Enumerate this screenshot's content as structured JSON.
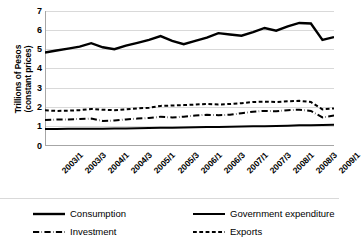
{
  "chart_data": {
    "type": "line",
    "title": "",
    "xlabel": "",
    "ylabel": "Trillions of Pesos (constant prices)",
    "ylabel_line1": "Trillions of Pesos",
    "ylabel_line2": "(constant prices)",
    "ylim": [
      0,
      7
    ],
    "ytick_values": [
      0,
      1,
      2,
      3,
      4,
      5,
      6,
      7
    ],
    "ytick_labels": [
      "0",
      "1",
      "2",
      "3",
      "4",
      "5",
      "6",
      "7"
    ],
    "grid": true,
    "grid_axis": "y",
    "legend_position": "bottom",
    "x": [
      "2003/1",
      "2003/2",
      "2003/3",
      "2003/4",
      "2004/1",
      "2004/2",
      "2004/3",
      "2004/4",
      "2005/1",
      "2005/2",
      "2005/3",
      "2005/4",
      "2006/1",
      "2006/2",
      "2006/3",
      "2006/4",
      "2007/1",
      "2007/2",
      "2007/3",
      "2007/4",
      "2008/1",
      "2008/2",
      "2008/3",
      "2008/4",
      "2009/1",
      "2009/2"
    ],
    "xtick_labels": [
      "2003/1",
      "2003/3",
      "2004/1",
      "2004/3",
      "2005/1",
      "2005/3",
      "2006/1",
      "2006/3",
      "2007/1",
      "2007/3",
      "2008/1",
      "2008/3",
      "2009/1"
    ],
    "series": [
      {
        "name": "Consumption",
        "style": "solid",
        "width": 2.4,
        "color": "#000000",
        "values": [
          4.85,
          4.95,
          5.05,
          5.15,
          5.33,
          5.12,
          5.02,
          5.2,
          5.35,
          5.5,
          5.7,
          5.45,
          5.28,
          5.45,
          5.62,
          5.85,
          5.78,
          5.72,
          5.9,
          6.12,
          5.98,
          6.2,
          6.38,
          6.35,
          5.5,
          5.65
        ]
      },
      {
        "name": "Government expenditure",
        "style": "solid",
        "width": 2.0,
        "color": "#000000",
        "values": [
          0.88,
          0.88,
          0.89,
          0.9,
          0.9,
          0.9,
          0.91,
          0.91,
          0.92,
          0.93,
          0.94,
          0.95,
          0.96,
          0.97,
          0.98,
          0.99,
          1.0,
          1.01,
          1.02,
          1.03,
          1.04,
          1.05,
          1.07,
          1.08,
          1.09,
          1.1
        ]
      },
      {
        "name": "Investment",
        "style": "dashdot",
        "width": 2.0,
        "color": "#000000",
        "values": [
          1.35,
          1.37,
          1.38,
          1.4,
          1.42,
          1.3,
          1.32,
          1.38,
          1.42,
          1.45,
          1.52,
          1.48,
          1.52,
          1.58,
          1.62,
          1.6,
          1.62,
          1.7,
          1.78,
          1.82,
          1.8,
          1.86,
          1.88,
          1.82,
          1.48,
          1.58
        ]
      },
      {
        "name": "Exports",
        "style": "dashed",
        "width": 2.0,
        "color": "#000000",
        "values": [
          1.85,
          1.82,
          1.83,
          1.86,
          1.92,
          1.88,
          1.86,
          1.9,
          1.95,
          1.98,
          2.08,
          2.1,
          2.12,
          2.15,
          2.18,
          2.15,
          2.18,
          2.22,
          2.28,
          2.3,
          2.28,
          2.32,
          2.34,
          2.28,
          1.9,
          1.95
        ]
      }
    ]
  },
  "legend": {
    "items": [
      {
        "label": "Consumption",
        "style": "solid-thick"
      },
      {
        "label": "Government expenditure",
        "style": "solid"
      },
      {
        "label": "Investment",
        "style": "dashdot"
      },
      {
        "label": "Exports",
        "style": "dashed"
      }
    ]
  },
  "colors": {
    "line": "#000000",
    "grid": "#d9d9d9",
    "axis": "#a6a6a6",
    "background": "#ffffff"
  }
}
